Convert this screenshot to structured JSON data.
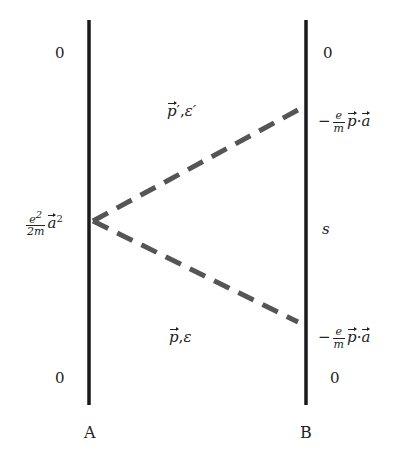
{
  "diagram": {
    "lines": {
      "A": {
        "label": "A",
        "x": 89,
        "y_top": 20,
        "y_bottom": 405
      },
      "B": {
        "label": "B",
        "x": 306,
        "y_top": 20,
        "y_bottom": 405
      }
    },
    "vertex": {
      "x": 92,
      "y": 221
    },
    "dashed_upper_end": {
      "x": 298,
      "y": 110
    },
    "dashed_lower_end": {
      "x": 298,
      "y": 322
    },
    "line_color": "#1a1a1a",
    "dash_color": "#555555",
    "labels": {
      "a_top_zero": "0",
      "a_bottom_zero": "0",
      "b_top_zero": "0",
      "b_bottom_zero": "0",
      "b_middle": "s",
      "vertex_num": "e",
      "vertex_num_sup": "2",
      "vertex_den": "2m",
      "vertex_vec": "a",
      "vertex_vec_sup": "2",
      "upper_state_p": "p",
      "upper_state_prime": "′,",
      "upper_state_eps": "ε′",
      "lower_state_p": "p",
      "lower_state_sep": ",",
      "lower_state_eps": "ε",
      "b_upper_minus": "−",
      "b_upper_num": "e",
      "b_upper_den": "m",
      "b_upper_p": "p",
      "b_upper_dot": "·",
      "b_upper_a": "a",
      "b_lower_minus": "−",
      "b_lower_num": "e",
      "b_lower_den": "m",
      "b_lower_p": "p",
      "b_lower_dot": "·",
      "b_lower_a": "a",
      "axis_A": "A",
      "axis_B": "B"
    }
  }
}
